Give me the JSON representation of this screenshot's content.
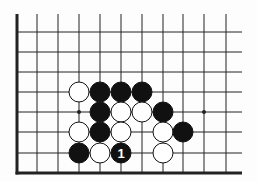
{
  "diagram": {
    "type": "go-board-fragment",
    "grid": {
      "columns_x": [
        17,
        37,
        58,
        79,
        100,
        121,
        142,
        163,
        183,
        204,
        226
      ],
      "rows_y": [
        32,
        52,
        72,
        92,
        112,
        132,
        153,
        173
      ],
      "top_extend_y": 14,
      "right_extend_x": 242,
      "left_edge": true,
      "bottom_edge": true
    },
    "star_points": [
      {
        "col": 3,
        "row": 4
      },
      {
        "col": 9,
        "row": 4
      }
    ],
    "stones": [
      {
        "color": "white",
        "col": 3,
        "row": 3
      },
      {
        "color": "black",
        "col": 4,
        "row": 3
      },
      {
        "color": "black",
        "col": 5,
        "row": 3
      },
      {
        "color": "black",
        "col": 6,
        "row": 3
      },
      {
        "color": "black",
        "col": 4,
        "row": 4
      },
      {
        "color": "white",
        "col": 5,
        "row": 4
      },
      {
        "color": "white",
        "col": 6,
        "row": 4
      },
      {
        "color": "black",
        "col": 7,
        "row": 4
      },
      {
        "color": "white",
        "col": 3,
        "row": 5
      },
      {
        "color": "black",
        "col": 4,
        "row": 5
      },
      {
        "color": "white",
        "col": 5,
        "row": 5
      },
      {
        "color": "white",
        "col": 7,
        "row": 5
      },
      {
        "color": "black",
        "col": 8,
        "row": 5
      },
      {
        "color": "black",
        "col": 3,
        "row": 6
      },
      {
        "color": "white",
        "col": 4,
        "row": 6
      },
      {
        "color": "black",
        "col": 5,
        "row": 6,
        "label": "1"
      },
      {
        "color": "white",
        "col": 7,
        "row": 6
      }
    ],
    "colors": {
      "line": "#222222",
      "black": "#111111",
      "white": "#ffffff",
      "background": "#fdfdfd"
    }
  }
}
